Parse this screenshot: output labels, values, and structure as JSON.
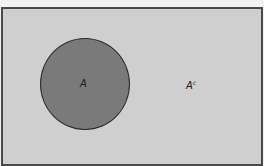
{
  "diagram": {
    "type": "venn",
    "universe": {
      "shape": "rectangle",
      "fill": "#cfcfcf",
      "border": "#4a4a4a"
    },
    "sets": [
      {
        "name": "A",
        "label": "A",
        "shape": "circle",
        "fill": "#7a7a7a"
      }
    ],
    "complement": {
      "base": "A",
      "superscript": "c"
    }
  }
}
